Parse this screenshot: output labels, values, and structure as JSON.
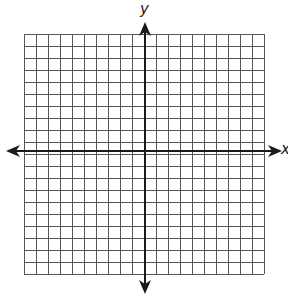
{
  "diagram": {
    "type": "coordinate-plane",
    "grid": {
      "cols": 20,
      "rows": 20,
      "cell_px": 12,
      "left": 24,
      "top": 34,
      "line_color": "#555555"
    },
    "axes": {
      "x": {
        "label": "x",
        "y_px": 151,
        "from_px": 6,
        "to_px": 282
      },
      "y": {
        "label": "y",
        "x_px": 145,
        "from_px": 22,
        "to_px": 294
      },
      "color": "#1a1a1a"
    }
  }
}
